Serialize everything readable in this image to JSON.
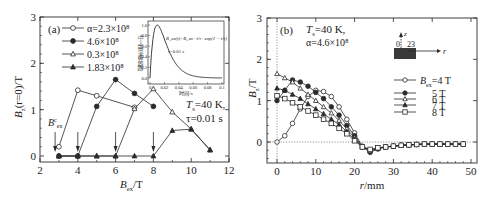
{
  "chart_data": [
    {
      "panel": "(a)",
      "type": "line",
      "xlabel": "B_ex / T",
      "ylabel": "B_z(r=0) / T",
      "xlim": [
        2,
        12
      ],
      "ylim": [
        -0.1,
        3
      ],
      "xticks": [
        2,
        4,
        6,
        8,
        10,
        12
      ],
      "yticks": [
        0,
        1,
        2,
        3
      ],
      "grid": false,
      "legend_position": "upper-left",
      "series": [
        {
          "name": "α=2.3×10⁸",
          "marker": "open-circle",
          "x": [
            3,
            4,
            5,
            7
          ],
          "y": [
            0.2,
            1.42,
            1.3,
            1.05
          ]
        },
        {
          "name": "4.6×10⁸",
          "marker": "filled-circle",
          "x": [
            3,
            4,
            5,
            6,
            7,
            8
          ],
          "y": [
            0,
            0,
            1.07,
            1.65,
            1.35,
            1.07
          ]
        },
        {
          "name": "0.3×10⁸",
          "marker": "open-triangle",
          "x": [
            3,
            4,
            5,
            6,
            7,
            8,
            9,
            10,
            11
          ],
          "y": [
            0,
            0,
            0,
            0,
            1.02,
            1.45,
            0.95,
            0.58,
            0.13
          ]
        },
        {
          "name": "1.83×10⁸",
          "marker": "filled-triangle",
          "x": [
            3,
            4,
            5,
            6,
            7,
            8,
            9,
            10,
            11
          ],
          "y": [
            0,
            0,
            0,
            0,
            0,
            0,
            0.55,
            0.58,
            0.13
          ]
        }
      ],
      "annotations": [
        {
          "text": "(a)",
          "position": "upper-left"
        },
        {
          "text": "B_ex^c",
          "position": "near x=3"
        },
        {
          "text": "T_s=40 K,",
          "position": "right"
        },
        {
          "text": "τ=0.01 s",
          "position": "right"
        },
        {
          "text": "arrows",
          "x": [
            2.8,
            4,
            6,
            8
          ]
        }
      ],
      "inset": {
        "type": "line",
        "formula": "B_ex(t)=B_ex · (t/τ) · exp(1 − t/τ)",
        "note": "τ=0.01 s",
        "xlabel": "时间/s",
        "ylabel": "归一化脉冲磁场强度",
        "xticks": [
          0,
          0.02,
          0.04,
          0.06,
          0.08,
          0.1
        ],
        "yticks": [
          0,
          0.2,
          0.4,
          0.6,
          0.8,
          1.0
        ],
        "xlim": [
          0,
          0.1
        ],
        "ylim": [
          0,
          1.0
        ]
      }
    },
    {
      "panel": "(b)",
      "type": "line",
      "xlabel": "r/mm",
      "ylabel": "B_z / T",
      "xlim": [
        -2,
        50
      ],
      "ylim": [
        -0.5,
        3
      ],
      "xticks": [
        0,
        10,
        20,
        30,
        40,
        50
      ],
      "yticks": [
        0,
        1,
        2,
        3
      ],
      "grid": false,
      "legend_position": "right",
      "annotations": [
        {
          "text": "(b)"
        },
        {
          "text": "T_s=40 K,"
        },
        {
          "text": "α=4.6×10⁸"
        },
        {
          "text": "schematic: z axis, r axis, 0, 23"
        }
      ],
      "x": [
        0,
        2,
        4,
        6,
        8,
        10,
        12,
        14,
        16,
        18,
        20,
        22,
        24,
        26,
        28,
        30,
        32,
        34,
        36,
        38,
        40,
        42,
        44,
        46,
        48
      ],
      "series": [
        {
          "name": "B_ex=4 T",
          "marker": "open-circle",
          "values": [
            0,
            0.15,
            0.45,
            0.8,
            1.1,
            1.25,
            1.22,
            1.1,
            0.85,
            0.55,
            0.22,
            -0.1,
            -0.2,
            -0.15,
            -0.12,
            -0.1,
            -0.08,
            -0.07,
            -0.06,
            -0.05,
            -0.05,
            -0.05,
            -0.05,
            -0.05,
            -0.05
          ]
        },
        {
          "name": "5 T",
          "marker": "filled-circle",
          "values": [
            1.0,
            1.25,
            1.5,
            1.45,
            1.35,
            1.2,
            1.05,
            0.85,
            0.65,
            0.4,
            0.15,
            -0.12,
            -0.25,
            -0.17,
            -0.12,
            -0.1,
            -0.08,
            -0.07,
            -0.06,
            -0.05,
            -0.05,
            -0.05,
            -0.05,
            -0.05,
            -0.05
          ]
        },
        {
          "name": "6 T",
          "marker": "open-triangle",
          "values": [
            1.65,
            1.55,
            1.45,
            1.3,
            1.15,
            1.0,
            0.85,
            0.7,
            0.52,
            0.32,
            0.1,
            -0.12,
            -0.22,
            -0.15,
            -0.12,
            -0.1,
            -0.08,
            -0.07,
            -0.06,
            -0.05,
            -0.05,
            -0.05,
            -0.05,
            -0.05,
            -0.05
          ]
        },
        {
          "name": "7 T",
          "marker": "filled-triangle",
          "values": [
            1.3,
            1.25,
            1.15,
            1.05,
            0.92,
            0.8,
            0.68,
            0.55,
            0.42,
            0.25,
            0.06,
            -0.12,
            -0.2,
            -0.15,
            -0.12,
            -0.1,
            -0.08,
            -0.07,
            -0.06,
            -0.05,
            -0.05,
            -0.05,
            -0.05,
            -0.05,
            -0.05
          ]
        },
        {
          "name": "8 T",
          "marker": "open-square",
          "values": [
            1.12,
            1.05,
            0.95,
            0.85,
            0.75,
            0.65,
            0.55,
            0.45,
            0.33,
            0.2,
            0.03,
            -0.12,
            -0.18,
            -0.14,
            -0.12,
            -0.1,
            -0.08,
            -0.07,
            -0.06,
            -0.05,
            -0.05,
            -0.05,
            -0.05,
            -0.05,
            -0.05
          ]
        }
      ]
    }
  ],
  "labels": {
    "a": {
      "panel": "(a)",
      "ylabel_main": "B",
      "ylabel_sub": "z",
      "ylabel_rest": "(r=0)/T",
      "xlabel_main": "B",
      "xlabel_sub": "ex",
      "xlabel_rest": "/T",
      "bexc_main": "B",
      "bexc_sup": "c",
      "bexc_sub": "ex",
      "ts_line": "T",
      "ts_sub": "s",
      "ts_rest": "=40 K,",
      "tau_line": "τ=0.01 s",
      "legend": [
        "α=2.3×10⁸",
        "4.6×10⁸",
        "0.3×10⁸",
        "1.83×10⁸"
      ],
      "inset_formula": "B_ex(t)=B_ex · t/τ · exp(1 − t/τ)",
      "inset_tau": "τ=0.01 s",
      "inset_xlabel": "时间/s",
      "inset_ylabel": "归一化脉冲磁场强度"
    },
    "b": {
      "panel": "(b)",
      "ts_line": "T",
      "ts_sub": "s",
      "ts_rest": "=40 K,",
      "alpha_line": "α=4.6×10⁸",
      "ylabel_main": "B",
      "ylabel_sub": "z",
      "ylabel_rest": "/T",
      "xlabel": "r/mm",
      "schem_z": "z",
      "schem_r": "r",
      "schem_0": "0",
      "schem_23": "23",
      "legend_first_main": "B",
      "legend_first_sub": "ex",
      "legend_first_rest": "=4 T",
      "legend": [
        "5 T",
        "6 T",
        "7 T",
        "8 T"
      ]
    }
  }
}
